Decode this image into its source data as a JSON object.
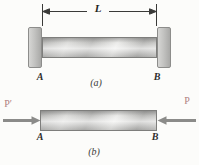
{
  "figure": {
    "part_a": {
      "dimension_label": "L",
      "end_label_left": "A",
      "end_label_right": "B",
      "caption": "(a)"
    },
    "part_b": {
      "force_label_left": "P′",
      "force_label_right": "P",
      "end_label_left": "A",
      "end_label_right": "B",
      "caption": "(b)"
    },
    "colors": {
      "bar_metal_gray": "#cdcdcb",
      "wall_gray": "#bdbdbb",
      "force_arrow_gray": "#8b8b89",
      "force_label_red": "#b08080",
      "dimension_line_dark": "#3a3a38"
    }
  }
}
